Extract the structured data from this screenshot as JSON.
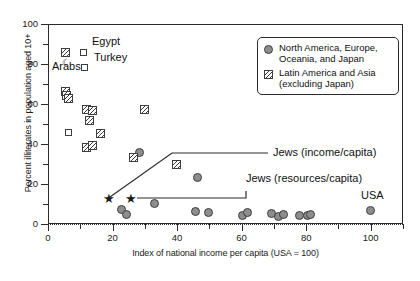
{
  "chart_data": {
    "type": "scatter",
    "title": "",
    "xlabel": "Index of national income per capita (USA = 100)",
    "ylabel": "Percent illiterates in population aged 10+",
    "xlim": [
      0,
      110
    ],
    "ylim": [
      -12,
      100
    ],
    "xticks": [
      0,
      20,
      40,
      60,
      80,
      100
    ],
    "yticks": [
      0,
      20,
      40,
      60,
      80,
      100
    ],
    "grid": false,
    "legend_position": "top-right",
    "series": [
      {
        "name": "North America, Europe, Oceania, and Japan",
        "marker": "filled-circle",
        "color": "#8d8d8d",
        "points": [
          {
            "x": 28.5,
            "y": 35.5
          },
          {
            "x": 23.0,
            "y": 7.0
          },
          {
            "x": 24.5,
            "y": 4.5
          },
          {
            "x": 33.0,
            "y": 10.0
          },
          {
            "x": 46.5,
            "y": 23.0
          },
          {
            "x": 46.0,
            "y": 6.0
          },
          {
            "x": 50.0,
            "y": 5.5
          },
          {
            "x": 60.5,
            "y": 4.0
          },
          {
            "x": 62.0,
            "y": 5.5
          },
          {
            "x": 69.5,
            "y": 5.0
          },
          {
            "x": 71.5,
            "y": 3.5
          },
          {
            "x": 73.0,
            "y": 4.5
          },
          {
            "x": 78.0,
            "y": 4.0
          },
          {
            "x": 80.5,
            "y": 4.0
          },
          {
            "x": 81.5,
            "y": 4.5
          },
          {
            "x": 100.0,
            "y": 6.5
          }
        ]
      },
      {
        "name": "Latin America and Asia (excluding Japan)",
        "marker": "hatched-square",
        "color": "#3d3d3d",
        "points": [
          {
            "x": 5.5,
            "y": 85.5
          },
          {
            "x": 5.5,
            "y": 66.0
          },
          {
            "x": 6.0,
            "y": 64.0
          },
          {
            "x": 6.5,
            "y": 62.5
          },
          {
            "x": 12.0,
            "y": 57.0
          },
          {
            "x": 14.0,
            "y": 56.5
          },
          {
            "x": 13.0,
            "y": 51.5
          },
          {
            "x": 16.5,
            "y": 45.0
          },
          {
            "x": 30.0,
            "y": 57.0
          },
          {
            "x": 12.0,
            "y": 38.0
          },
          {
            "x": 14.0,
            "y": 39.0
          },
          {
            "x": 26.5,
            "y": 33.0
          },
          {
            "x": 40.0,
            "y": 29.5
          }
        ]
      },
      {
        "name": "Open squares",
        "marker": "open-square",
        "color": "#3d3d3d",
        "points": [
          {
            "x": 11.0,
            "y": 85.5
          },
          {
            "x": 11.5,
            "y": 78.0
          },
          {
            "x": 6.5,
            "y": 45.5
          }
        ]
      },
      {
        "name": "Jews reference markers",
        "marker": "star",
        "color": "#1a1a1a",
        "points": [
          {
            "x": 18.5,
            "y": 12.5
          },
          {
            "x": 25.5,
            "y": 12.5
          }
        ]
      }
    ],
    "annotations": [
      {
        "label": "Egypt",
        "x": 11.0,
        "y": 85.5
      },
      {
        "label": "Turkey",
        "x": 11.5,
        "y": 78.0
      },
      {
        "label": "Arabs",
        "x": 5.5,
        "y": 79.0
      },
      {
        "label": "USA",
        "x": 100.0,
        "y": 6.5
      },
      {
        "label": "Jews (income/capita)",
        "x": 18.5,
        "y": 12.5
      },
      {
        "label": "Jews (resources/capita)",
        "x": 25.5,
        "y": 12.5
      }
    ]
  },
  "axes": {
    "y_title": "Percent illiterates in population aged 10+",
    "x_title": "Index of national income per capita (USA = 100)",
    "y_ticks": [
      "0",
      "20",
      "40",
      "60",
      "80",
      "100"
    ],
    "x_ticks": [
      "0",
      "20",
      "40",
      "60",
      "80",
      "100"
    ]
  },
  "legend": {
    "items": [
      {
        "marker": "filled-circle",
        "line1": "North America, Europe,",
        "line2": "Oceania, and Japan"
      },
      {
        "marker": "hatched-square",
        "line1": "Latin America and Asia",
        "line2": "(excluding Japan)"
      }
    ]
  },
  "annotations": {
    "egypt": "Egypt",
    "turkey": "Turkey",
    "arabs": "Arabs",
    "usa": "USA",
    "jews_income": "Jews (income/capita)",
    "jews_resources": "Jews (resources/capita)"
  },
  "colors": {
    "marker_fill": "#8d8d8d",
    "marker_edge": "#3d3d3d",
    "axis": "#2b2b2b",
    "background": "#ffffff"
  }
}
